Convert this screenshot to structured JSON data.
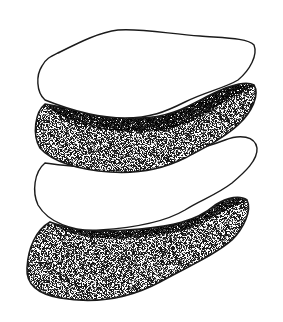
{
  "illustration": {
    "subject": "stack of four stones",
    "background": "#ffffff",
    "ink": "#1a1a1a",
    "stones": [
      {
        "name": "stone-1",
        "fill": "plain"
      },
      {
        "name": "stone-2",
        "fill": "stippled"
      },
      {
        "name": "stone-3",
        "fill": "plain"
      },
      {
        "name": "stone-4",
        "fill": "stippled"
      }
    ]
  }
}
